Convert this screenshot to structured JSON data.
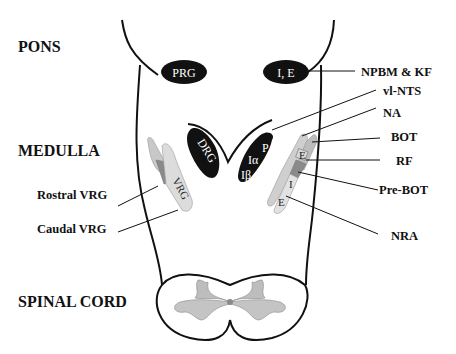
{
  "regions": {
    "pons": "PONS",
    "medulla": "MEDULLA",
    "spinal_cord": "SPINAL CORD"
  },
  "nuclei": {
    "prg": "PRG",
    "ie": "I, E",
    "drg": "DRG",
    "p": "P",
    "i_alpha": "Iα",
    "i_beta": "Iβ",
    "vrg": "VRG",
    "e_upper": "E",
    "i_mid": "I",
    "e_lower": "E"
  },
  "labels": {
    "npbm_kf": "NPBM & KF",
    "vl_nts": "vl-NTS",
    "na": "NA",
    "bot": "BOT",
    "rf": "RF",
    "pre_bot": "Pre-BOT",
    "nra": "NRA",
    "rostral_vrg": "Rostral VRG",
    "caudal_vrg": "Caudal VRG"
  },
  "colors": {
    "outline": "#111111",
    "nucleus_dark": "#111111",
    "vrg_light": "#d8d8d8",
    "vrg_mid": "#b8b8b8",
    "vrg_dark": "#8a8a8a",
    "gray_matter": "#bdbdbd"
  }
}
